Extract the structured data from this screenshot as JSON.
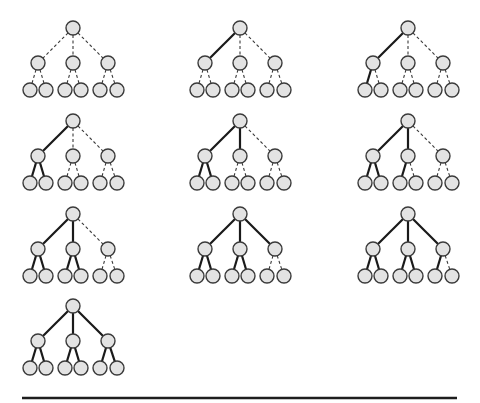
{
  "diagram": {
    "type": "tree-traversal-sequence",
    "colors": {
      "node_fill": "#e3e3e3",
      "node_stroke": "#3a3a3a",
      "solid_edge": "#1a1a1a",
      "dashed_edge": "#3a3a3a",
      "baseline": "#1e1e1e"
    },
    "node_radius": 7,
    "layout_offsets": {
      "root": [
        0,
        0
      ],
      "children": [
        [
          -35,
          35
        ],
        [
          0,
          35
        ],
        [
          35,
          35
        ]
      ],
      "leaves": [
        [
          -43,
          62
        ],
        [
          -27,
          62
        ],
        [
          -8,
          62
        ],
        [
          8,
          62
        ],
        [
          27,
          62
        ],
        [
          44,
          62
        ]
      ]
    },
    "edge_order": [
      "root-A",
      "A-a1",
      "A-a2",
      "root-B",
      "B-b1",
      "B-b2",
      "root-C",
      "C-c1",
      "C-c2"
    ],
    "snapshots": [
      {
        "index": 1,
        "root": [
          73,
          28
        ],
        "solid_edges": 0
      },
      {
        "index": 2,
        "root": [
          240,
          28
        ],
        "solid_edges": 1
      },
      {
        "index": 3,
        "root": [
          408,
          28
        ],
        "solid_edges": 2
      },
      {
        "index": 4,
        "root": [
          73,
          121
        ],
        "solid_edges": 3
      },
      {
        "index": 5,
        "root": [
          240,
          121
        ],
        "solid_edges": 4
      },
      {
        "index": 6,
        "root": [
          408,
          121
        ],
        "solid_edges": 5
      },
      {
        "index": 7,
        "root": [
          73,
          214
        ],
        "solid_edges": 6
      },
      {
        "index": 8,
        "root": [
          240,
          214
        ],
        "solid_edges": 7
      },
      {
        "index": 9,
        "root": [
          408,
          214
        ],
        "solid_edges": 8
      },
      {
        "index": 10,
        "root": [
          73,
          306
        ],
        "solid_edges": 9
      }
    ],
    "baseline": {
      "x1": 22,
      "x2": 457,
      "y": 398
    }
  }
}
